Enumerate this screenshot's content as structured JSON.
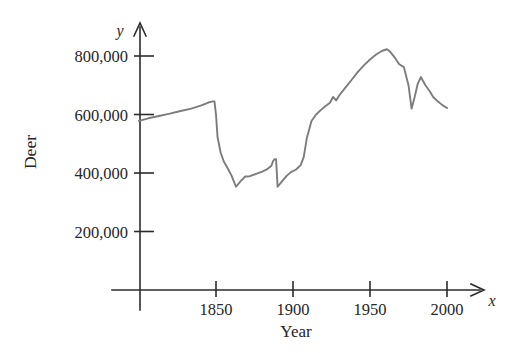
{
  "chart_data": {
    "type": "line",
    "title": "",
    "subtitle": "",
    "xlabel": "Year",
    "ylabel": "Deer",
    "x_axis_symbol": "x",
    "y_axis_symbol": "y",
    "xlim": [
      1800,
      2010
    ],
    "ylim": [
      0,
      900000
    ],
    "grid": false,
    "legend": null,
    "xticks": [
      1850,
      1900,
      1950,
      2000
    ],
    "xtick_labels": [
      "1850",
      "1900",
      "1950",
      "2000"
    ],
    "yticks": [
      200000,
      400000,
      600000,
      800000
    ],
    "ytick_labels": [
      "200,000",
      "400,000",
      "600,000",
      "800,000"
    ],
    "line_color": "#7c7c7c",
    "axis_color": "#2b2b2b",
    "series": [
      {
        "name": "Deer population",
        "x": [
          1800,
          1806,
          1813,
          1820,
          1827,
          1834,
          1841,
          1845,
          1848,
          1849,
          1850,
          1851,
          1853,
          1855,
          1858,
          1860,
          1863,
          1866,
          1869,
          1872,
          1876,
          1880,
          1883,
          1886,
          1887,
          1888,
          1889,
          1890,
          1893,
          1896,
          1899,
          1902,
          1905,
          1907,
          1909,
          1912,
          1915,
          1918,
          1921,
          1924,
          1926,
          1928,
          1930,
          1934,
          1938,
          1942,
          1946,
          1950,
          1954,
          1958,
          1961,
          1963,
          1966,
          1969,
          1972,
          1975,
          1977,
          1979,
          1981,
          1983,
          1986,
          1989,
          1991,
          1994,
          1997,
          2000
        ],
        "values": [
          578000,
          587000,
          595000,
          603000,
          612000,
          620000,
          632000,
          641000,
          645000,
          645000,
          600000,
          523000,
          470000,
          440000,
          412000,
          392000,
          353000,
          372000,
          388000,
          389000,
          397000,
          405000,
          412000,
          425000,
          440000,
          447000,
          447000,
          353000,
          372000,
          391000,
          404000,
          412000,
          427000,
          455000,
          520000,
          578000,
          600000,
          615000,
          628000,
          640000,
          660000,
          648000,
          665000,
          692000,
          718000,
          745000,
          768000,
          788000,
          805000,
          818000,
          823000,
          815000,
          795000,
          772000,
          762000,
          700000,
          620000,
          660000,
          705000,
          728000,
          700000,
          678000,
          660000,
          645000,
          632000,
          622000
        ]
      }
    ],
    "annotations": []
  }
}
